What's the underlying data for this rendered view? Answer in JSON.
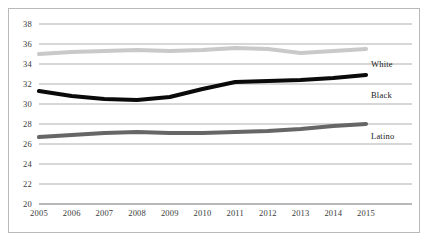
{
  "chart_data": {
    "type": "line",
    "title": "",
    "subtitle": "",
    "xlabel": "",
    "ylabel": "",
    "x": [
      2005,
      2006,
      2007,
      2008,
      2009,
      2010,
      2011,
      2012,
      2013,
      2014,
      2015
    ],
    "xticklabels": [
      "2005",
      "2006",
      "2007",
      "2008",
      "2009",
      "2010",
      "2011",
      "2012",
      "2013",
      "2014",
      "2015"
    ],
    "yticks": [
      20,
      22,
      24,
      26,
      28,
      30,
      32,
      34,
      36,
      38
    ],
    "yticklabels": [
      "20",
      "22",
      "24",
      "26",
      "28",
      "30",
      "32",
      "34",
      "36",
      "38"
    ],
    "ylim": [
      20,
      38
    ],
    "xlim": [
      2005,
      2015
    ],
    "grid": "horizontal",
    "legend_position": "inline-right-of-line-end",
    "series": [
      {
        "name": "White",
        "color": "#c9c9c9",
        "label": "White",
        "label_value_position": 34.0,
        "values": [
          35.0,
          35.2,
          35.3,
          35.4,
          35.3,
          35.4,
          35.6,
          35.5,
          35.1,
          35.3,
          35.5
        ]
      },
      {
        "name": "Black",
        "color": "#0a0a0a",
        "label": "Black",
        "label_value_position": 30.9,
        "values": [
          31.3,
          30.8,
          30.5,
          30.4,
          30.7,
          31.5,
          32.2,
          32.3,
          32.4,
          32.6,
          32.9
        ]
      },
      {
        "name": "Latino",
        "color": "#666666",
        "label": "Latino",
        "label_value_position": 26.8,
        "values": [
          26.7,
          26.9,
          27.1,
          27.2,
          27.1,
          27.1,
          27.2,
          27.3,
          27.5,
          27.8,
          28.0
        ]
      }
    ]
  }
}
